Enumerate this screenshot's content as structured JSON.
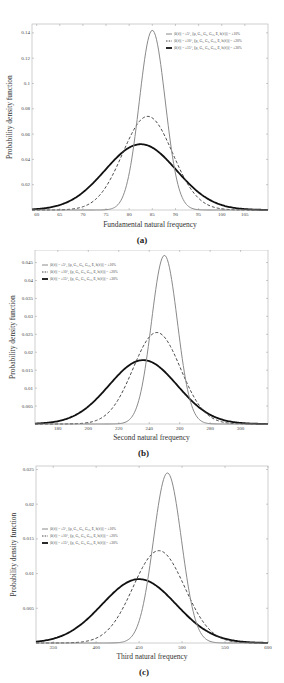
{
  "figure": {
    "ylabel": "Probability density function",
    "legend": [
      "|θ(ℓ)| = ±5°,  |(ρ, G₁, G₂, G₁₂, E, h(ℓ))| = ±10%",
      "|θ(ℓ)| = ±10°,  |(ρ, G₁, G₂, G₁₂, E, h(ℓ))| = ±20%",
      "|θ(ℓ)| = ±15°,  |(ρ, G₁, G₂, G₁₂, E, h(ℓ))| = ±30%"
    ]
  },
  "chart_data": [
    {
      "type": "line",
      "panel_label": "(a)",
      "title": "",
      "xlabel": "Fundamental natural frequency",
      "ylabel": "Probability density function",
      "xlim": [
        59,
        110
      ],
      "ylim": [
        0,
        0.147
      ],
      "xticks": [
        60,
        65,
        70,
        75,
        80,
        85,
        90,
        95,
        100,
        105
      ],
      "yticks": [
        0.02,
        0.04,
        0.06,
        0.08,
        0.1,
        0.12,
        0.14
      ],
      "ytick_labels": [
        "0.02",
        "0.04",
        "0.06",
        "0.08",
        "0.1",
        "0.12",
        "0.14"
      ],
      "grid": false,
      "legend_position": "upper right",
      "series": [
        {
          "name": "|θ(ℓ)| = ±5°, |(ρ,G₁,G₂,G₁₂,E,h(ℓ))| = ±10%",
          "style": "solid-gray",
          "mean": 85,
          "peak": 0.142,
          "sigma": 2.8
        },
        {
          "name": "|θ(ℓ)| = ±10°, |(ρ,G₁,G₂,G₁₂,E,h(ℓ))| = ±20%",
          "style": "dashed",
          "mean": 84,
          "peak": 0.074,
          "sigma": 5.4
        },
        {
          "name": "|θ(ℓ)| = ±15°, |(ρ,G₁,G₂,G₁₂,E,h(ℓ))| = ±30%",
          "style": "thick-black",
          "mean": 82.5,
          "peak": 0.052,
          "sigma": 7.7
        }
      ]
    },
    {
      "type": "line",
      "panel_label": "(b)",
      "title": "",
      "xlabel": "Second natural frequency",
      "ylabel": "Probability density function",
      "xlim": [
        165,
        318
      ],
      "ylim": [
        0,
        0.0485
      ],
      "xticks": [
        180,
        200,
        220,
        240,
        260,
        280,
        300
      ],
      "yticks": [
        0.005,
        0.01,
        0.015,
        0.02,
        0.025,
        0.03,
        0.035,
        0.04,
        0.045
      ],
      "ytick_labels": [
        "0.005",
        "0.01",
        "0.015",
        "0.02",
        "0.025",
        "0.03",
        "0.035",
        "0.04",
        "0.045"
      ],
      "grid": false,
      "legend_position": "upper left",
      "series": [
        {
          "name": "|θ(ℓ)| = ±5°, |(ρ,G₁,G₂,G₁₂,E,h(ℓ))| = ±10%",
          "style": "solid-gray",
          "mean": 250,
          "peak": 0.047,
          "sigma": 8.5
        },
        {
          "name": "|θ(ℓ)| = ±10°, |(ρ,G₁,G₂,G₁₂,E,h(ℓ))| = ±20%",
          "style": "dashed",
          "mean": 245,
          "peak": 0.0255,
          "sigma": 15.6
        },
        {
          "name": "|θ(ℓ)| = ±15°, |(ρ,G₁,G₂,G₁₂,E,h(ℓ))| = ±30%",
          "style": "thick-black",
          "mean": 236,
          "peak": 0.0178,
          "sigma": 22.4
        }
      ]
    },
    {
      "type": "line",
      "panel_label": "(c)",
      "title": "",
      "xlabel": "Third natural frequency",
      "ylabel": "Probability density function",
      "xlim": [
        330,
        600
      ],
      "ylim": [
        0,
        0.0255
      ],
      "xticks": [
        350,
        400,
        450,
        500,
        550,
        600
      ],
      "yticks": [
        0.005,
        0.01,
        0.015,
        0.02,
        0.025
      ],
      "ytick_labels": [
        "0.005",
        "0.01",
        "0.015",
        "0.02",
        "0.025"
      ],
      "grid": false,
      "legend_position": "middle left",
      "series": [
        {
          "name": "|θ(ℓ)| = ±5°, |(ρ,G₁,G₂,G₁₂,E,h(ℓ))| = ±10%",
          "style": "solid-gray",
          "mean": 483,
          "peak": 0.0245,
          "sigma": 16.3
        },
        {
          "name": "|θ(ℓ)| = ±10°, |(ρ,G₁,G₂,G₁₂,E,h(ℓ))| = ±20%",
          "style": "dashed",
          "mean": 473,
          "peak": 0.0133,
          "sigma": 30
        },
        {
          "name": "|θ(ℓ)| = ±15°, |(ρ,G₁,G₂,G₁₂,E,h(ℓ))| = ±30%",
          "style": "thick-black",
          "mean": 450,
          "peak": 0.0092,
          "sigma": 43
        }
      ]
    }
  ],
  "layout": {
    "panels": [
      {
        "top": 0,
        "height": 250,
        "frame": {
          "x0": 32,
          "y0": 24,
          "x1": 268,
          "y1": 210
        },
        "legend": {
          "x": 166,
          "y": 34
        },
        "xlabel_y": 227,
        "panel_label_y": 243
      },
      {
        "top": 250,
        "height": 210,
        "frame": {
          "x0": 35,
          "y0": -1,
          "x1": 268,
          "y1": 174
        },
        "legend": {
          "x": 42,
          "y": 15
        },
        "xlabel_y": 190,
        "panel_label_y": 206
      },
      {
        "top": 460,
        "height": 223,
        "frame": {
          "x0": 36,
          "y0": 6,
          "x1": 268,
          "y1": 183
        },
        "legend": {
          "x": 42,
          "y": 69
        },
        "xlabel_y": 199,
        "panel_label_y": 215
      }
    ]
  }
}
